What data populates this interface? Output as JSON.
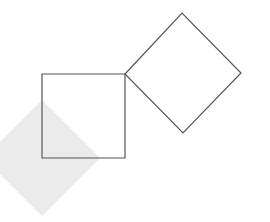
{
  "diagram": {
    "width": 270,
    "height": 222,
    "background": "#ffffff",
    "shapes": [
      {
        "id": "shaded-diamond",
        "type": "polygon",
        "points": "42,100 100,158 42,216 -16,158",
        "fill": "#ebebeb",
        "stroke": "none"
      },
      {
        "id": "square",
        "type": "polygon",
        "points": "42,74 125,74 125,158 42,158",
        "fill": "none",
        "stroke": "#555555"
      },
      {
        "id": "outlined-diamond",
        "type": "polygon",
        "points": "125,74 182,13 241,73 183,133",
        "fill": "none",
        "stroke": "#555555"
      }
    ]
  }
}
